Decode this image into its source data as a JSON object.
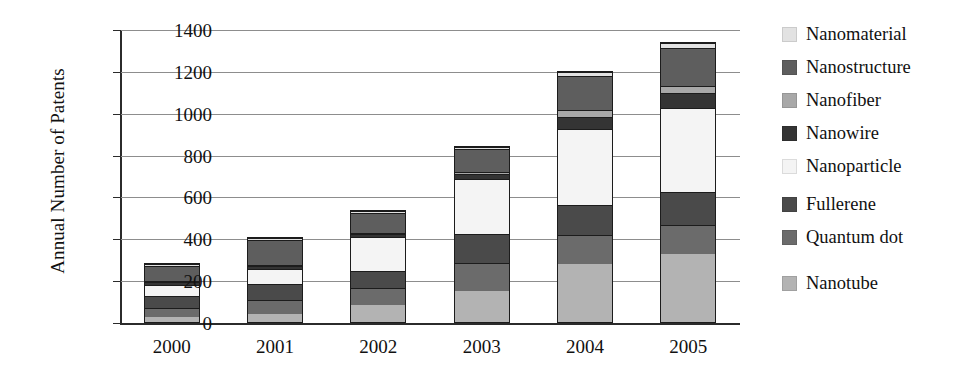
{
  "chart_data": {
    "type": "bar",
    "subtype": "stacked-bar",
    "title": "",
    "xlabel": "",
    "ylabel": "Annual Number of Patents",
    "categories": [
      "2000",
      "2001",
      "2002",
      "2003",
      "2004",
      "2005"
    ],
    "ylim": [
      0,
      1400
    ],
    "ytick_values": [
      0,
      200,
      400,
      600,
      800,
      1000,
      1200,
      1400
    ],
    "ytick_labels": [
      "0",
      "200",
      "400",
      "600",
      "800",
      "1000",
      "1200",
      "1400"
    ],
    "grid": true,
    "legend_position": "right",
    "stack_order_bottom_to_top": [
      "Nanotube",
      "Quantum dot",
      "Fullerene",
      "Nanoparticle",
      "Nanowire",
      "Nanofiber",
      "Nanostructure",
      "Nanomaterial"
    ],
    "series": [
      {
        "name": "Nanomaterial",
        "color": "#e2e2e2",
        "values": [
          10,
          10,
          10,
          10,
          20,
          25
        ]
      },
      {
        "name": "Nanostructure",
        "color": "#5e5e5e",
        "values": [
          70,
          120,
          95,
          110,
          165,
          185
        ]
      },
      {
        "name": "Nanofiber",
        "color": "#a8a8a8",
        "values": [
          5,
          5,
          5,
          10,
          35,
          35
        ]
      },
      {
        "name": "Nanowire",
        "color": "#343434",
        "values": [
          15,
          15,
          15,
          25,
          55,
          70
        ]
      },
      {
        "name": "Nanoparticle",
        "color": "#f4f4f4",
        "values": [
          55,
          75,
          165,
          265,
          365,
          405
        ]
      },
      {
        "name": "Fullerene",
        "color": "#4a4a4a",
        "values": [
          60,
          75,
          85,
          140,
          145,
          160
        ]
      },
      {
        "name": "Quantum dot",
        "color": "#6b6b6b",
        "values": [
          45,
          70,
          80,
          135,
          140,
          140
        ]
      },
      {
        "name": "Nanotube",
        "color": "#b3b3b3",
        "values": [
          25,
          40,
          85,
          150,
          280,
          325
        ]
      }
    ],
    "totals": [
      285,
      410,
      540,
      845,
      1205,
      1345
    ]
  },
  "legend": {
    "items": [
      {
        "label": "Nanomaterial",
        "color": "#e2e2e2"
      },
      {
        "label": "Nanostructure",
        "color": "#5e5e5e"
      },
      {
        "label": "Nanofiber",
        "color": "#a8a8a8"
      },
      {
        "label": "Nanowire",
        "color": "#343434"
      },
      {
        "label": "Nanoparticle",
        "color": "#f4f4f4"
      },
      {
        "label": "Fullerene",
        "color": "#4a4a4a"
      },
      {
        "label": "Quantum dot",
        "color": "#6b6b6b"
      },
      {
        "label": "Nanotube",
        "color": "#b3b3b3"
      }
    ],
    "row_gaps_px": [
      0,
      0,
      0,
      0,
      0,
      14,
      0,
      22
    ]
  }
}
